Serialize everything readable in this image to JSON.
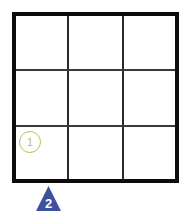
{
  "grid": {
    "rows": 3,
    "cols": 3,
    "border_color": "#0d0d0d",
    "line_color": "#2a2a2a"
  },
  "markers": [
    {
      "shape": "circle",
      "label": "1",
      "row": 3,
      "col": 1,
      "color": "#a9c94c"
    },
    {
      "shape": "triangle",
      "label": "2",
      "position": "below column 1 right edge",
      "color": "#3d519c",
      "text_color": "#ffffff"
    }
  ]
}
